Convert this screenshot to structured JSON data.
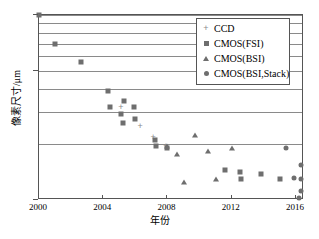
{
  "chart_data": {
    "type": "scatter",
    "title": "",
    "xlabel": "年份",
    "ylabel": "像素尺寸/μm",
    "xlim": [
      2000,
      2016.5
    ],
    "ylim": [
      1,
      10
    ],
    "yscale": "log",
    "xscale": "linear",
    "grid": true,
    "grid_axis": "y",
    "legend_position": "upper right",
    "xticks": [
      2000,
      2004,
      2008,
      2012,
      2016
    ],
    "xtick_labels": [
      "2000",
      "2004",
      "2008",
      "2012",
      "2016"
    ],
    "yticks": [
      1,
      5,
      10
    ],
    "ytick_labels": [
      "1",
      "5",
      "10"
    ],
    "y_gridlines": [
      2,
      3,
      4,
      5,
      6,
      7,
      8,
      9,
      10
    ],
    "series": [
      {
        "name": "CCD",
        "marker": "plus",
        "color": "#8a8a8a",
        "points": [
          {
            "x": 2005.1,
            "y": 3.2
          },
          {
            "x": 2006.3,
            "y": 2.5
          },
          {
            "x": 2007.1,
            "y": 2.2
          },
          {
            "x": 2007.9,
            "y": 1.95
          }
        ]
      },
      {
        "name": "CMOS(FSI)",
        "marker": "square",
        "color": "#6e6e6e",
        "points": [
          {
            "x": 2000.0,
            "y": 10.0
          },
          {
            "x": 2001.0,
            "y": 7.0
          },
          {
            "x": 2002.6,
            "y": 5.6
          },
          {
            "x": 2004.3,
            "y": 3.9
          },
          {
            "x": 2005.3,
            "y": 3.45
          },
          {
            "x": 2004.4,
            "y": 3.2
          },
          {
            "x": 2005.1,
            "y": 2.9
          },
          {
            "x": 2005.9,
            "y": 3.2
          },
          {
            "x": 2006.0,
            "y": 2.75
          },
          {
            "x": 2005.2,
            "y": 2.6
          },
          {
            "x": 2007.2,
            "y": 2.1
          },
          {
            "x": 2007.3,
            "y": 1.95
          },
          {
            "x": 2008.0,
            "y": 1.9
          },
          {
            "x": 2011.6,
            "y": 1.45
          },
          {
            "x": 2012.5,
            "y": 1.42
          },
          {
            "x": 2012.6,
            "y": 1.3
          },
          {
            "x": 2013.8,
            "y": 1.38
          },
          {
            "x": 2015.0,
            "y": 1.3
          }
        ]
      },
      {
        "name": "CMOS(BSI)",
        "marker": "triangle",
        "color": "#6e6e6e",
        "points": [
          {
            "x": 2008.0,
            "y": 1.95
          },
          {
            "x": 2008.6,
            "y": 1.78
          },
          {
            "x": 2009.7,
            "y": 2.25
          },
          {
            "x": 2009.0,
            "y": 1.25
          },
          {
            "x": 2010.5,
            "y": 1.85
          },
          {
            "x": 2011.0,
            "y": 1.3
          },
          {
            "x": 2012.0,
            "y": 1.9
          }
        ]
      },
      {
        "name": "CMOS(BSI,Stack)",
        "marker": "circle",
        "color": "#6e6e6e",
        "points": [
          {
            "x": 2015.4,
            "y": 1.9
          },
          {
            "x": 2015.9,
            "y": 1.32
          },
          {
            "x": 2016.3,
            "y": 1.55
          },
          {
            "x": 2016.3,
            "y": 1.3
          },
          {
            "x": 2016.3,
            "y": 1.12
          },
          {
            "x": 2016.2,
            "y": 1.03
          }
        ]
      }
    ]
  },
  "legend": {
    "items": [
      {
        "label": "CCD",
        "marker": "plus"
      },
      {
        "label": "CMOS(FSI)",
        "marker": "square"
      },
      {
        "label": "CMOS(BSI)",
        "marker": "triangle"
      },
      {
        "label": "CMOS(BSI,Stack)",
        "marker": "circle"
      }
    ]
  },
  "axes": {
    "x_title": "年份",
    "y_title": "像素尺寸/μm"
  }
}
